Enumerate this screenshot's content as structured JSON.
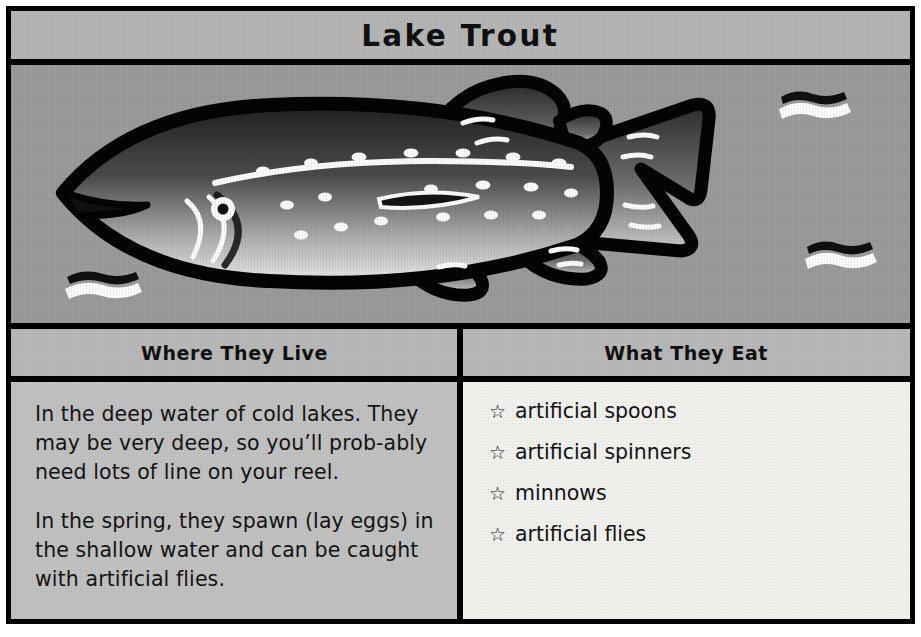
{
  "card": {
    "title": "Lake Trout",
    "colors": {
      "frame": "#000000",
      "title_bar_bg": "#b9b9b9",
      "art_bg": "#9d9d9d",
      "header_bg": "#b9b9b9",
      "left_body_bg": "#c2c2c2",
      "right_body_bg": "#f2f2ef",
      "text": "#141414",
      "fish_outline": "#000000",
      "fish_dark": "#2b2b2b",
      "fish_light": "#e8e8e8",
      "accent_white": "#ffffff"
    }
  },
  "illustration": {
    "subject": "lake-trout-fish",
    "alt": "Side view of a spotted lake trout swimming left, with water wave marks in the background",
    "water_marks": 3
  },
  "sections": [
    {
      "id": "where-they-live",
      "header": "Where They Live",
      "paragraphs": [
        "In the deep water of cold lakes. They may be very deep, so you’ll prob-ably need lots of line on your reel.",
        "In the spring, they spawn (lay eggs) in the shallow water and can be caught with artificial flies."
      ]
    },
    {
      "id": "what-they-eat",
      "header": "What They Eat",
      "bullet_glyph": "☆",
      "items": [
        "artificial spoons",
        "artificial spinners",
        "minnows",
        "artificial flies"
      ]
    }
  ]
}
